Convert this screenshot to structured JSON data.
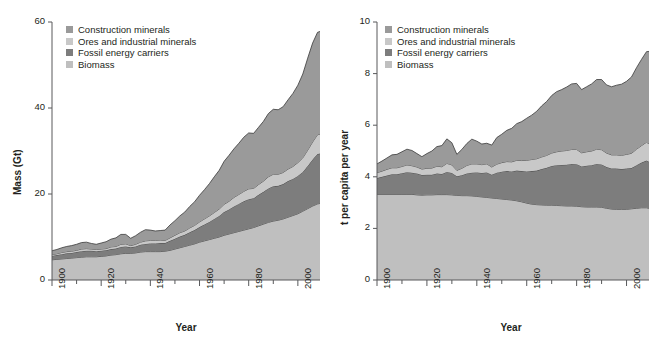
{
  "figure": {
    "background": "#ffffff",
    "axis_color": "#58595b",
    "line_color": "#3a3a3a"
  },
  "series_colors": {
    "construction_minerals": "#9a9a9a",
    "ores_and_industrial_minerals": "#c8c8c8",
    "fossil_energy_carriers": "#7d7d7d",
    "biomass": "#bfbfbf"
  },
  "legend": {
    "items": [
      {
        "label": "Construction minerals",
        "color": "#9a9a9a",
        "swatch_name": "legend-swatch-construction-minerals"
      },
      {
        "label": "Ores and industrial minerals",
        "color": "#c8c8c8",
        "swatch_name": "legend-swatch-ores"
      },
      {
        "label": "Fossil energy carriers",
        "color": "#7d7d7d",
        "swatch_name": "legend-swatch-fossil"
      },
      {
        "label": "Biomass",
        "color": "#bfbfbf",
        "swatch_name": "legend-swatch-biomass"
      }
    ]
  },
  "chart_data": [
    {
      "id": "global-material-extraction-mass",
      "type": "area",
      "stacked": true,
      "title": "",
      "xlabel": "Year",
      "ylabel": "Mass (Gt)",
      "xlim": [
        1900,
        2009
      ],
      "ylim": [
        0,
        60
      ],
      "yticks": [
        0,
        20,
        40,
        60
      ],
      "ytick_labels": [
        "0",
        "20",
        "40",
        "60"
      ],
      "xticks": [
        1900,
        1920,
        1940,
        1960,
        1980,
        2000
      ],
      "xtick_labels": [
        "1900",
        "1920",
        "1940",
        "1960",
        "1980",
        "2000"
      ],
      "xminor_step": 10,
      "grid": false,
      "legend_position": "top-left",
      "stack_order_bottom_to_top": [
        "Biomass",
        "Fossil energy carriers",
        "Ores and industrial minerals",
        "Construction minerals"
      ],
      "x": [
        1900,
        1902,
        1904,
        1906,
        1908,
        1910,
        1912,
        1914,
        1916,
        1918,
        1920,
        1922,
        1924,
        1926,
        1928,
        1930,
        1932,
        1934,
        1936,
        1938,
        1940,
        1942,
        1944,
        1946,
        1948,
        1950,
        1952,
        1954,
        1956,
        1958,
        1960,
        1962,
        1964,
        1966,
        1968,
        1970,
        1972,
        1974,
        1976,
        1978,
        1980,
        1982,
        1984,
        1986,
        1988,
        1990,
        1992,
        1994,
        1996,
        1998,
        2000,
        2002,
        2004,
        2006,
        2008,
        2009
      ],
      "series": [
        {
          "name": "Biomass",
          "color": "#bfbfbf",
          "values": [
            4.7,
            4.8,
            4.9,
            5.0,
            5.1,
            5.2,
            5.3,
            5.4,
            5.4,
            5.4,
            5.5,
            5.6,
            5.8,
            5.9,
            6.1,
            6.2,
            6.2,
            6.3,
            6.5,
            6.6,
            6.6,
            6.6,
            6.6,
            6.7,
            6.9,
            7.2,
            7.5,
            7.8,
            8.1,
            8.4,
            8.8,
            9.1,
            9.4,
            9.7,
            10.0,
            10.4,
            10.7,
            11.0,
            11.3,
            11.6,
            11.9,
            12.2,
            12.6,
            13.0,
            13.4,
            13.7,
            13.9,
            14.2,
            14.6,
            15.0,
            15.4,
            16.0,
            16.6,
            17.2,
            17.7,
            17.8
          ]
        },
        {
          "name": "Fossil energy carriers",
          "color": "#7d7d7d",
          "values": [
            0.9,
            1.0,
            1.1,
            1.2,
            1.2,
            1.3,
            1.4,
            1.4,
            1.4,
            1.3,
            1.3,
            1.3,
            1.4,
            1.4,
            1.6,
            1.6,
            1.4,
            1.5,
            1.7,
            1.8,
            1.9,
            1.9,
            2.0,
            1.9,
            2.2,
            2.4,
            2.6,
            2.7,
            3.0,
            3.2,
            3.5,
            3.8,
            4.1,
            4.5,
            4.9,
            5.4,
            5.7,
            6.1,
            6.4,
            6.7,
            6.9,
            6.8,
            7.2,
            7.5,
            7.9,
            8.1,
            8.0,
            8.1,
            8.4,
            8.5,
            8.8,
            9.1,
            9.9,
            10.8,
            11.6,
            11.6
          ]
        },
        {
          "name": "Ores and industrial minerals",
          "color": "#c8c8c8",
          "values": [
            0.3,
            0.3,
            0.4,
            0.4,
            0.4,
            0.4,
            0.5,
            0.5,
            0.4,
            0.4,
            0.4,
            0.4,
            0.5,
            0.5,
            0.6,
            0.6,
            0.4,
            0.5,
            0.6,
            0.7,
            0.7,
            0.7,
            0.7,
            0.6,
            0.7,
            0.8,
            0.9,
            0.9,
            1.0,
            1.1,
            1.2,
            1.3,
            1.4,
            1.5,
            1.6,
            1.8,
            1.9,
            2.1,
            2.2,
            2.3,
            2.4,
            2.3,
            2.4,
            2.5,
            2.7,
            2.8,
            2.7,
            2.7,
            2.8,
            2.9,
            3.1,
            3.3,
            3.7,
            4.1,
            4.5,
            4.5
          ]
        },
        {
          "name": "Construction minerals",
          "color": "#9a9a9a",
          "values": [
            0.9,
            1.0,
            1.1,
            1.2,
            1.3,
            1.4,
            1.5,
            1.5,
            1.3,
            1.2,
            1.4,
            1.6,
            1.8,
            2.0,
            2.3,
            2.2,
            1.7,
            2.0,
            2.3,
            2.6,
            2.4,
            2.2,
            2.2,
            2.4,
            3.0,
            3.4,
            3.9,
            4.4,
            5.0,
            5.5,
            6.2,
            6.8,
            7.5,
            8.3,
            9.0,
            10.0,
            10.7,
            11.3,
            11.9,
            12.6,
            13.0,
            12.8,
            13.3,
            13.9,
            14.7,
            15.1,
            15.0,
            15.3,
            16.1,
            17.0,
            18.0,
            19.5,
            21.4,
            23.0,
            23.8,
            23.9
          ]
        }
      ]
    },
    {
      "id": "global-material-extraction-per-capita",
      "type": "area",
      "stacked": true,
      "title": "",
      "xlabel": "Year",
      "ylabel": "t per capita per year",
      "xlim": [
        1900,
        2009
      ],
      "ylim": [
        0,
        10
      ],
      "yticks": [
        0,
        2,
        4,
        6,
        8,
        10
      ],
      "ytick_labels": [
        "0",
        "2",
        "4",
        "6",
        "8",
        "10"
      ],
      "xticks": [
        1900,
        1920,
        1940,
        1960,
        1980,
        2000
      ],
      "xtick_labels": [
        "1900",
        "1920",
        "1940",
        "1960",
        "1980",
        "2000"
      ],
      "xminor_step": 10,
      "grid": false,
      "legend_position": "top-left",
      "stack_order_bottom_to_top": [
        "Biomass",
        "Fossil energy carriers",
        "Ores and industrial minerals",
        "Construction minerals"
      ],
      "x": [
        1900,
        1902,
        1904,
        1906,
        1908,
        1910,
        1912,
        1914,
        1916,
        1918,
        1920,
        1922,
        1924,
        1926,
        1928,
        1930,
        1932,
        1934,
        1936,
        1938,
        1940,
        1942,
        1944,
        1946,
        1948,
        1950,
        1952,
        1954,
        1956,
        1958,
        1960,
        1962,
        1964,
        1966,
        1968,
        1970,
        1972,
        1974,
        1976,
        1978,
        1980,
        1982,
        1984,
        1986,
        1988,
        1990,
        1992,
        1994,
        1996,
        1998,
        2000,
        2002,
        2004,
        2006,
        2008,
        2009
      ],
      "series": [
        {
          "name": "Biomass",
          "color": "#bfbfbf",
          "values": [
            3.32,
            3.32,
            3.32,
            3.32,
            3.32,
            3.32,
            3.32,
            3.32,
            3.3,
            3.29,
            3.3,
            3.3,
            3.31,
            3.31,
            3.31,
            3.3,
            3.28,
            3.27,
            3.27,
            3.26,
            3.24,
            3.22,
            3.2,
            3.18,
            3.16,
            3.14,
            3.12,
            3.1,
            3.07,
            3.03,
            2.98,
            2.94,
            2.92,
            2.91,
            2.9,
            2.9,
            2.89,
            2.88,
            2.87,
            2.87,
            2.86,
            2.84,
            2.83,
            2.83,
            2.83,
            2.82,
            2.78,
            2.75,
            2.74,
            2.74,
            2.74,
            2.76,
            2.78,
            2.8,
            2.8,
            2.78
          ]
        },
        {
          "name": "Fossil energy carriers",
          "color": "#7d7d7d",
          "values": [
            0.63,
            0.68,
            0.73,
            0.78,
            0.78,
            0.82,
            0.86,
            0.84,
            0.83,
            0.78,
            0.78,
            0.78,
            0.82,
            0.8,
            0.88,
            0.85,
            0.74,
            0.79,
            0.86,
            0.9,
            0.93,
            0.93,
            0.97,
            0.9,
            1.0,
            1.06,
            1.1,
            1.11,
            1.17,
            1.19,
            1.23,
            1.28,
            1.32,
            1.39,
            1.45,
            1.52,
            1.56,
            1.58,
            1.6,
            1.63,
            1.63,
            1.56,
            1.6,
            1.62,
            1.67,
            1.66,
            1.6,
            1.57,
            1.58,
            1.56,
            1.58,
            1.58,
            1.67,
            1.75,
            1.83,
            1.8
          ]
        },
        {
          "name": "Ores and industrial minerals",
          "color": "#c8c8c8",
          "values": [
            0.21,
            0.22,
            0.24,
            0.25,
            0.25,
            0.26,
            0.28,
            0.27,
            0.25,
            0.23,
            0.25,
            0.26,
            0.28,
            0.28,
            0.33,
            0.31,
            0.23,
            0.27,
            0.31,
            0.34,
            0.33,
            0.32,
            0.33,
            0.3,
            0.33,
            0.35,
            0.37,
            0.37,
            0.4,
            0.41,
            0.43,
            0.45,
            0.46,
            0.47,
            0.48,
            0.5,
            0.52,
            0.54,
            0.55,
            0.56,
            0.57,
            0.53,
            0.54,
            0.55,
            0.57,
            0.57,
            0.54,
            0.53,
            0.53,
            0.53,
            0.55,
            0.57,
            0.62,
            0.66,
            0.71,
            0.7
          ]
        },
        {
          "name": "Construction minerals",
          "color": "#9a9a9a",
          "values": [
            0.34,
            0.39,
            0.44,
            0.5,
            0.52,
            0.57,
            0.61,
            0.59,
            0.52,
            0.48,
            0.57,
            0.66,
            0.76,
            0.82,
            0.95,
            0.86,
            0.62,
            0.73,
            0.85,
            0.96,
            0.88,
            0.8,
            0.8,
            0.85,
            1.03,
            1.1,
            1.21,
            1.3,
            1.42,
            1.51,
            1.63,
            1.72,
            1.84,
            1.98,
            2.09,
            2.23,
            2.33,
            2.38,
            2.46,
            2.54,
            2.56,
            2.45,
            2.52,
            2.6,
            2.7,
            2.72,
            2.64,
            2.64,
            2.7,
            2.76,
            2.83,
            2.96,
            3.16,
            3.34,
            3.51,
            3.58
          ]
        }
      ]
    }
  ]
}
